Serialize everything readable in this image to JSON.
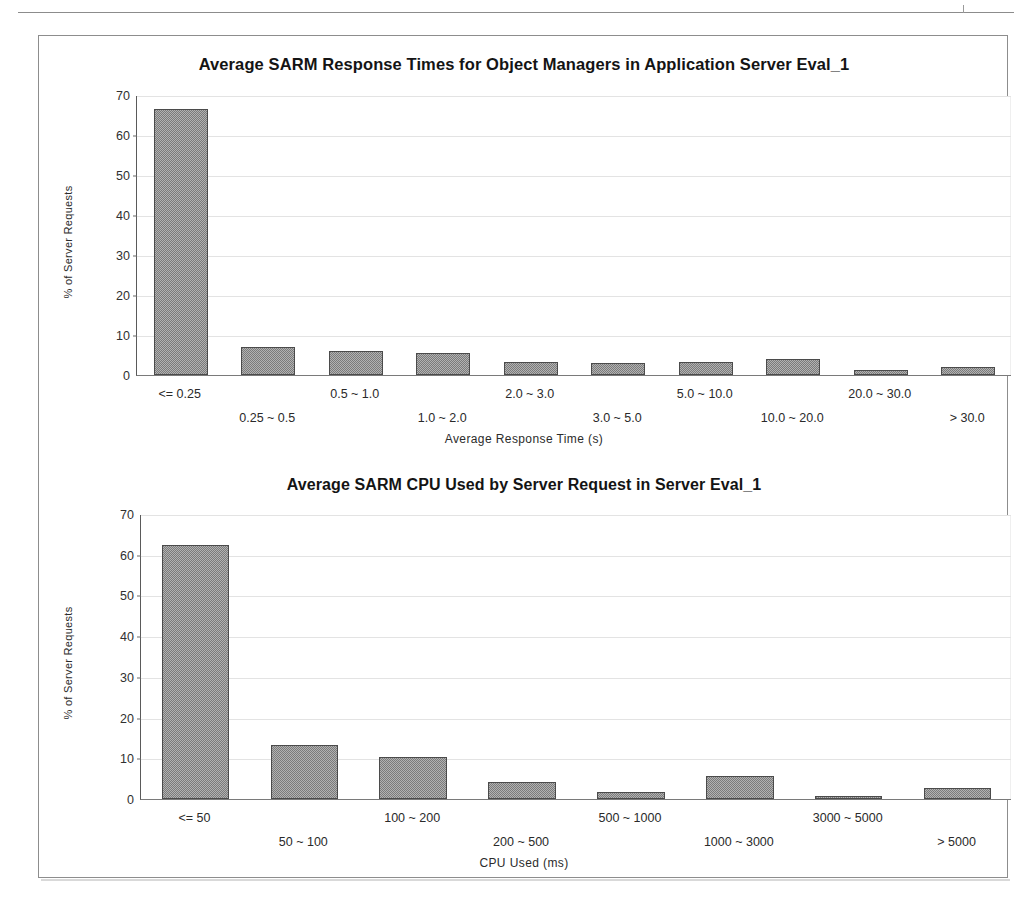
{
  "page": {
    "background_color": "#ffffff",
    "frame_color": "#8d8d8d",
    "bar_color": "#7b7b7b",
    "bar_border_color": "#4b4b4b",
    "gridline_color": "#e3e3e3"
  },
  "chart_data": [
    {
      "type": "bar",
      "id": "response-times",
      "title": "Average SARM Response Times for Object Managers in Application Server Eval_1",
      "xlabel": "Average Response Time (s)",
      "ylabel": "% of Server Requests",
      "ylim": [
        0,
        70
      ],
      "yticks": [
        0,
        10,
        20,
        30,
        40,
        50,
        60,
        70
      ],
      "grid": true,
      "legend": "none",
      "categories": [
        "<= 0.25",
        "0.25 ~ 0.5",
        "0.5 ~ 1.0",
        "1.0 ~ 2.0",
        "2.0 ~ 3.0",
        "3.0 ~ 5.0",
        "5.0 ~ 10.0",
        "10.0 ~ 20.0",
        "20.0 ~ 30.0",
        "> 30.0"
      ],
      "values": [
        66.5,
        7.0,
        6.0,
        5.5,
        3.3,
        3.0,
        3.2,
        4.0,
        1.2,
        2.0
      ]
    },
    {
      "type": "bar",
      "id": "cpu-used",
      "title": "Average SARM CPU Used by Server Request in Server Eval_1",
      "xlabel": "CPU Used (ms)",
      "ylabel": "% of Server Requests",
      "ylim": [
        0,
        70
      ],
      "yticks": [
        0,
        10,
        20,
        30,
        40,
        50,
        60,
        70
      ],
      "grid": true,
      "legend": "none",
      "categories": [
        "<= 50",
        "50 ~ 100",
        "100 ~ 200",
        "200 ~ 500",
        "500 ~ 1000",
        "1000 ~ 3000",
        "3000 ~ 5000",
        "> 5000"
      ],
      "values": [
        62.3,
        13.2,
        10.2,
        4.3,
        1.7,
        5.6,
        0.8,
        2.7
      ]
    }
  ]
}
